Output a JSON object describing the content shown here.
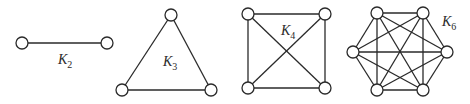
{
  "graphs": [
    {
      "id": "k2",
      "label": "K",
      "subscript": "2",
      "vertices": 2
    },
    {
      "id": "k3",
      "label": "K",
      "subscript": "3",
      "vertices": 3
    },
    {
      "id": "k4",
      "label": "K",
      "subscript": "4",
      "vertices": 4
    },
    {
      "id": "k6",
      "label": "K",
      "subscript": "6",
      "vertices": 6
    }
  ],
  "colors": {
    "stroke": "#2a2a2a",
    "node_fill": "#ffffff",
    "background": "#ffffff"
  }
}
